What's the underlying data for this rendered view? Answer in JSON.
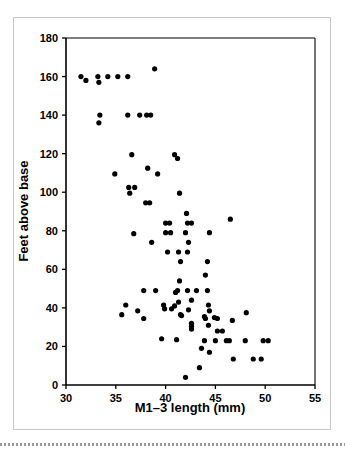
{
  "figure": {
    "name": "scatter-plot-m1-3-length-vs-feet-above-base",
    "background_color": "#ffffff",
    "frame_color": "#c8c8c8",
    "point_color": "#000000"
  },
  "chart_data": {
    "type": "scatter",
    "title": "",
    "subtitle": "",
    "xlabel": "M1–3 length (mm)",
    "ylabel": "Feet above base",
    "xlim": [
      30,
      55
    ],
    "ylim": [
      0,
      180
    ],
    "xticks": [
      30,
      35,
      40,
      45,
      50,
      55
    ],
    "xtick_labels": [
      "30",
      "35",
      "40",
      "45",
      "50",
      "55"
    ],
    "yticks": [
      0,
      20,
      40,
      60,
      80,
      100,
      120,
      140,
      160,
      180
    ],
    "ytick_labels": [
      "0",
      "20",
      "40",
      "60",
      "80",
      "100",
      "120",
      "140",
      "160",
      "180"
    ],
    "grid": false,
    "legend": null,
    "legend_position": "none",
    "marker": "circle",
    "marker_size": 2.6,
    "series": [
      {
        "name": "specimens",
        "points": [
          [
            31.5,
            160.0
          ],
          [
            32.0,
            158.0
          ],
          [
            33.2,
            160.0
          ],
          [
            33.3,
            157.0
          ],
          [
            34.2,
            160.0
          ],
          [
            35.2,
            160.0
          ],
          [
            36.2,
            160.0
          ],
          [
            38.9,
            164.0
          ],
          [
            33.4,
            140.0
          ],
          [
            33.3,
            136.0
          ],
          [
            36.2,
            140.0
          ],
          [
            37.4,
            140.0
          ],
          [
            38.1,
            140.0
          ],
          [
            38.5,
            140.0
          ],
          [
            36.6,
            119.5
          ],
          [
            40.9,
            119.5
          ],
          [
            41.2,
            117.5
          ],
          [
            38.2,
            112.5
          ],
          [
            34.9,
            109.5
          ],
          [
            39.2,
            109.5
          ],
          [
            36.3,
            102.5
          ],
          [
            36.9,
            102.5
          ],
          [
            36.4,
            99.5
          ],
          [
            41.4,
            99.5
          ],
          [
            38.0,
            94.5
          ],
          [
            38.4,
            94.5
          ],
          [
            42.1,
            89.0
          ],
          [
            46.5,
            86.0
          ],
          [
            40.0,
            84.0
          ],
          [
            40.4,
            84.0
          ],
          [
            42.2,
            84.0
          ],
          [
            42.6,
            84.0
          ],
          [
            36.8,
            78.5
          ],
          [
            40.0,
            79.0
          ],
          [
            40.5,
            79.0
          ],
          [
            42.0,
            79.0
          ],
          [
            44.4,
            79.0
          ],
          [
            38.6,
            74.0
          ],
          [
            42.3,
            74.0
          ],
          [
            40.2,
            69.0
          ],
          [
            41.3,
            69.0
          ],
          [
            42.2,
            69.0
          ],
          [
            41.5,
            64.0
          ],
          [
            44.2,
            64.0
          ],
          [
            44.0,
            57.0
          ],
          [
            41.4,
            54.0
          ],
          [
            41.2,
            49.0
          ],
          [
            42.2,
            49.0
          ],
          [
            43.1,
            49.0
          ],
          [
            44.2,
            49.0
          ],
          [
            37.8,
            49.0
          ],
          [
            39.0,
            49.0
          ],
          [
            41.0,
            48.0
          ],
          [
            42.6,
            44.0
          ],
          [
            41.3,
            43.0
          ],
          [
            44.3,
            41.5
          ],
          [
            36.0,
            41.5
          ],
          [
            39.8,
            41.5
          ],
          [
            40.9,
            41.0
          ],
          [
            39.9,
            39.5
          ],
          [
            40.6,
            39.5
          ],
          [
            42.3,
            39.0
          ],
          [
            44.4,
            38.5
          ],
          [
            48.1,
            37.5
          ],
          [
            37.2,
            38.5
          ],
          [
            35.6,
            36.5
          ],
          [
            41.5,
            36.5
          ],
          [
            41.6,
            36.0
          ],
          [
            43.9,
            35.5
          ],
          [
            44.0,
            34.5
          ],
          [
            44.9,
            35.0
          ],
          [
            45.2,
            34.5
          ],
          [
            37.8,
            34.5
          ],
          [
            46.7,
            33.5
          ],
          [
            42.6,
            32.0
          ],
          [
            42.6,
            30.5
          ],
          [
            44.3,
            31.0
          ],
          [
            42.6,
            29.0
          ],
          [
            45.2,
            28.0
          ],
          [
            45.7,
            28.0
          ],
          [
            39.6,
            24.0
          ],
          [
            41.1,
            23.5
          ],
          [
            43.9,
            23.0
          ],
          [
            45.0,
            23.0
          ],
          [
            46.1,
            23.0
          ],
          [
            46.4,
            23.0
          ],
          [
            48.0,
            23.0
          ],
          [
            49.8,
            23.0
          ],
          [
            50.3,
            23.0
          ],
          [
            43.6,
            19.0
          ],
          [
            44.4,
            17.0
          ],
          [
            46.8,
            13.5
          ],
          [
            48.8,
            13.5
          ],
          [
            49.6,
            13.5
          ],
          [
            43.4,
            9.0
          ],
          [
            42.0,
            4.0
          ]
        ]
      }
    ]
  }
}
